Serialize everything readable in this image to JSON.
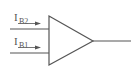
{
  "diagram": {
    "type": "op-amp input bias currents",
    "inputs": [
      {
        "label_main": "I",
        "label_sub": "B2",
        "name": "input-bias-current-2"
      },
      {
        "label_main": "I",
        "label_sub": "B1",
        "name": "input-bias-current-1"
      }
    ],
    "colors": {
      "line": "#555555",
      "background": "#ffffff"
    }
  }
}
